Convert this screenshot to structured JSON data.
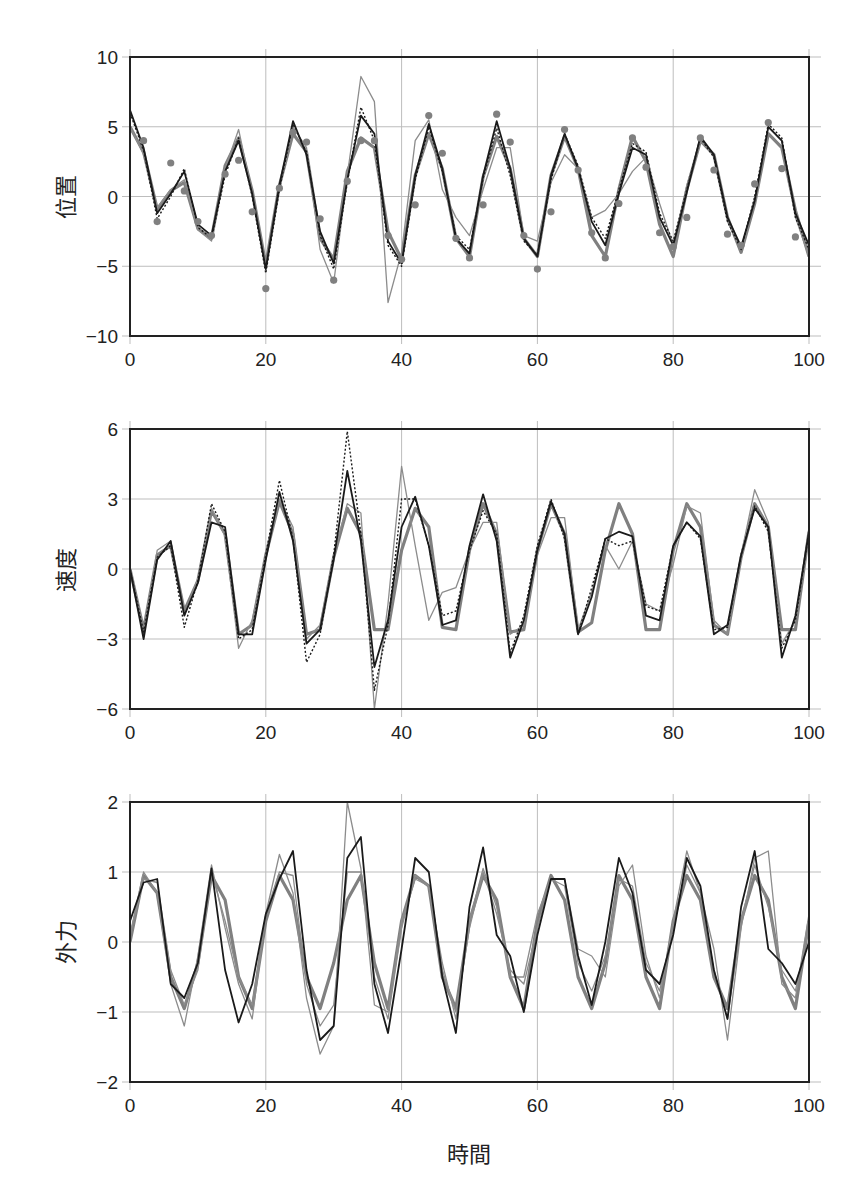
{
  "figure": {
    "xlabel": "時間",
    "x_ticks": [
      "0",
      "20",
      "40",
      "60",
      "80",
      "100"
    ]
  },
  "panels": [
    {
      "ylabel": "位置",
      "y_ticks": [
        "10",
        "5",
        "0",
        "−5",
        "−10"
      ]
    },
    {
      "ylabel": "速度",
      "y_ticks": [
        "6",
        "3",
        "0",
        "−3",
        "−6"
      ]
    },
    {
      "ylabel": "外力",
      "y_ticks": [
        "2",
        "1",
        "0",
        "−1",
        "−2"
      ]
    }
  ],
  "styles": {
    "true": {
      "color": "#808080",
      "width": 3.2,
      "dash": ""
    },
    "thin_gray": {
      "color": "#8c8c8c",
      "width": 1.3,
      "dash": ""
    },
    "black_solid": {
      "color": "#1a1a1a",
      "width": 1.8,
      "dash": ""
    },
    "black_dotted": {
      "color": "#1a1a1a",
      "width": 1.4,
      "dash": "2,2"
    },
    "dots": {
      "color": "#808080",
      "radius": 3.6
    },
    "axis": "#222222",
    "grid": "#bdbdbd"
  },
  "chart_data": [
    {
      "type": "line",
      "title": "",
      "xlabel": "時間",
      "ylabel": "位置",
      "xlim": [
        0,
        100
      ],
      "ylim": [
        -10,
        10
      ],
      "grid": true,
      "x": [
        0,
        2,
        4,
        6,
        8,
        10,
        12,
        14,
        16,
        18,
        20,
        22,
        24,
        26,
        28,
        30,
        32,
        34,
        36,
        38,
        40,
        42,
        44,
        46,
        48,
        50,
        52,
        54,
        56,
        58,
        60,
        62,
        64,
        66,
        68,
        70,
        72,
        74,
        76,
        78,
        80,
        82,
        84,
        86,
        88,
        90,
        92,
        94,
        96,
        98,
        100
      ],
      "series": [
        {
          "name": "true",
          "style": "true",
          "values": [
            5.0,
            3.2,
            -0.9,
            0.4,
            1.0,
            -2.3,
            -3.0,
            2.2,
            4.2,
            0.4,
            -4.9,
            0.8,
            4.5,
            3.2,
            -3.0,
            -4.5,
            1.8,
            4.2,
            3.5,
            -2.5,
            -4.5,
            1.5,
            4.5,
            2.0,
            -3.0,
            -4.3,
            1.4,
            4.3,
            2.0,
            -3.0,
            -4.3,
            1.5,
            4.3,
            2.0,
            -2.8,
            -4.3,
            0.5,
            4.3,
            2.5,
            -2.0,
            -4.3,
            0.5,
            4.0,
            3.0,
            -1.5,
            -4.0,
            -0.5,
            4.5,
            3.5,
            -1.0,
            -4.3
          ]
        },
        {
          "name": "thin_gray",
          "style": "thin_gray",
          "values": [
            5.0,
            3.0,
            -0.8,
            0.5,
            1.2,
            -2.4,
            -3.2,
            2.0,
            4.8,
            0.2,
            -5.2,
            0.5,
            5.0,
            3.5,
            -3.8,
            -6.2,
            1.5,
            8.6,
            6.8,
            -7.6,
            -4.0,
            4.0,
            5.5,
            0.5,
            -1.5,
            -2.8,
            0.5,
            3.5,
            3.5,
            -2.8,
            -3.2,
            1.0,
            3.0,
            2.0,
            -1.5,
            -1.0,
            0.2,
            1.8,
            2.8,
            -0.5,
            -3.5,
            0.8,
            4.0,
            3.0,
            -1.8,
            -3.8,
            -0.2,
            5.0,
            4.0,
            -1.5,
            -4.3
          ]
        },
        {
          "name": "black_solid",
          "style": "black_solid",
          "values": [
            6.2,
            3.5,
            -1.2,
            0.2,
            1.8,
            -2.0,
            -2.8,
            1.8,
            4.0,
            0.2,
            -5.2,
            0.8,
            5.4,
            3.0,
            -2.5,
            -4.8,
            1.2,
            5.8,
            4.5,
            -3.2,
            -4.8,
            1.5,
            5.2,
            2.0,
            -3.0,
            -4.1,
            1.5,
            5.4,
            2.0,
            -3.0,
            -4.3,
            1.5,
            4.5,
            2.0,
            -1.8,
            -3.5,
            0.2,
            3.5,
            3.0,
            -1.5,
            -3.5,
            0.3,
            4.3,
            3.0,
            -1.5,
            -3.6,
            -0.3,
            5.0,
            4.0,
            -1.2,
            -3.5
          ]
        },
        {
          "name": "black_dotted",
          "style": "black_dotted",
          "values": [
            6.0,
            3.3,
            -1.6,
            0.0,
            2.0,
            -2.2,
            -3.0,
            1.5,
            4.2,
            0.0,
            -5.5,
            0.5,
            5.2,
            3.2,
            -2.8,
            -5.2,
            1.0,
            6.4,
            4.0,
            -3.5,
            -5.0,
            1.2,
            5.0,
            1.8,
            -2.8,
            -3.8,
            1.3,
            4.9,
            1.5,
            -3.2,
            -4.2,
            1.2,
            4.5,
            2.2,
            -1.5,
            -3.0,
            0.5,
            3.8,
            3.2,
            -1.2,
            -3.2,
            0.5,
            4.2,
            2.8,
            -1.8,
            -3.8,
            0.0,
            5.2,
            4.2,
            -1.5,
            -3.8
          ]
        }
      ],
      "observations": {
        "name": "observations",
        "style": "dots",
        "x": [
          2,
          4,
          6,
          8,
          10,
          12,
          14,
          16,
          18,
          20,
          22,
          24,
          26,
          28,
          30,
          32,
          34,
          36,
          38,
          40,
          42,
          44,
          46,
          48,
          50,
          52,
          54,
          56,
          58,
          60,
          62,
          64,
          66,
          68,
          70,
          72,
          74,
          76,
          78,
          80,
          82,
          84,
          86,
          88,
          90,
          92,
          94,
          96,
          98
        ],
        "y": [
          4.0,
          -1.8,
          2.4,
          0.4,
          -1.8,
          -2.8,
          1.6,
          2.6,
          -1.1,
          -6.6,
          0.6,
          4.6,
          3.9,
          -1.6,
          -6.0,
          1.1,
          4.0,
          4.0,
          -2.8,
          -4.5,
          -0.6,
          5.8,
          3.1,
          -3.0,
          -4.4,
          -0.6,
          5.9,
          3.9,
          -2.8,
          -5.2,
          -1.1,
          4.8,
          1.9,
          -2.6,
          -4.4,
          -0.5,
          4.2,
          2.1,
          -2.6,
          -3.6,
          -1.5,
          4.2,
          1.9,
          -2.7,
          -3.5,
          0.9,
          5.3,
          2.0,
          -2.9
        ]
      }
    },
    {
      "type": "line",
      "title": "",
      "xlabel": "時間",
      "ylabel": "速度",
      "xlim": [
        0,
        100
      ],
      "ylim": [
        -6,
        6
      ],
      "grid": true,
      "x": [
        0,
        2,
        4,
        6,
        8,
        10,
        12,
        14,
        16,
        18,
        20,
        22,
        24,
        26,
        28,
        30,
        32,
        34,
        36,
        38,
        40,
        42,
        44,
        46,
        48,
        50,
        52,
        54,
        56,
        58,
        60,
        62,
        64,
        66,
        68,
        70,
        72,
        74,
        76,
        78,
        80,
        82,
        84,
        86,
        88,
        90,
        92,
        94,
        96,
        98,
        100
      ],
      "series": [
        {
          "name": "true",
          "style": "true",
          "values": [
            0.0,
            -2.6,
            0.6,
            1.0,
            -1.8,
            -0.5,
            2.5,
            1.5,
            -2.8,
            -2.4,
            0.6,
            2.9,
            1.5,
            -2.8,
            -2.6,
            0.5,
            2.6,
            1.5,
            -2.6,
            -2.6,
            0.8,
            2.6,
            1.8,
            -2.5,
            -2.6,
            0.8,
            2.8,
            1.5,
            -2.7,
            -2.6,
            0.8,
            2.8,
            1.5,
            -2.7,
            -2.3,
            0.8,
            2.8,
            1.5,
            -2.6,
            -2.6,
            0.8,
            2.8,
            1.8,
            -2.4,
            -2.8,
            0.5,
            2.8,
            1.8,
            -2.6,
            -2.6,
            1.6
          ]
        },
        {
          "name": "thin_gray",
          "style": "thin_gray",
          "values": [
            0.0,
            -2.8,
            0.8,
            1.2,
            -2.0,
            -0.4,
            2.6,
            1.4,
            -3.4,
            -2.2,
            0.5,
            3.0,
            1.8,
            -3.0,
            -2.4,
            0.6,
            2.8,
            2.4,
            -6.0,
            -1.5,
            4.4,
            1.0,
            -2.2,
            -1.0,
            -0.8,
            0.8,
            2.0,
            2.0,
            -2.8,
            -2.4,
            0.6,
            2.2,
            2.2,
            -2.6,
            -1.0,
            1.0,
            0.0,
            1.2,
            -1.5,
            -1.8,
            0.2,
            2.7,
            2.4,
            -2.2,
            -2.8,
            0.6,
            3.4,
            2.0,
            -3.2,
            -2.2,
            1.8
          ]
        },
        {
          "name": "black_solid",
          "style": "black_solid",
          "values": [
            0.0,
            -3.0,
            0.4,
            1.2,
            -2.0,
            -0.6,
            2.0,
            1.8,
            -2.8,
            -2.8,
            0.4,
            3.3,
            1.2,
            -3.2,
            -2.6,
            0.4,
            4.2,
            1.2,
            -4.2,
            -2.2,
            1.8,
            3.1,
            1.0,
            -2.4,
            -2.2,
            1.0,
            3.2,
            1.2,
            -3.8,
            -2.2,
            0.8,
            2.9,
            1.5,
            -2.8,
            -1.2,
            1.3,
            1.6,
            1.4,
            -2.0,
            -2.2,
            1.0,
            2.0,
            1.4,
            -2.8,
            -2.4,
            0.6,
            2.6,
            1.8,
            -3.8,
            -2.0,
            1.6
          ]
        },
        {
          "name": "black_dotted",
          "style": "black_dotted",
          "values": [
            0.0,
            -2.7,
            0.5,
            1.0,
            -2.5,
            -0.5,
            2.8,
            1.6,
            -3.0,
            -2.6,
            0.6,
            3.8,
            1.3,
            -4.0,
            -2.8,
            0.6,
            5.9,
            1.5,
            -5.2,
            -2.4,
            3.0,
            3.0,
            1.0,
            -2.0,
            -1.8,
            0.8,
            2.5,
            1.5,
            -3.6,
            -2.0,
            1.0,
            3.0,
            1.3,
            -2.8,
            -0.8,
            1.3,
            1.0,
            1.2,
            -1.6,
            -1.8,
            1.0,
            2.0,
            1.3,
            -2.6,
            -2.5,
            0.6,
            2.7,
            1.6,
            -3.4,
            -2.2,
            1.6
          ]
        }
      ]
    },
    {
      "type": "line",
      "title": "",
      "xlabel": "時間",
      "ylabel": "外力",
      "xlim": [
        0,
        100
      ],
      "ylim": [
        -2,
        2
      ],
      "grid": true,
      "x": [
        0,
        2,
        4,
        6,
        8,
        10,
        12,
        14,
        16,
        18,
        20,
        22,
        24,
        26,
        28,
        30,
        32,
        34,
        36,
        38,
        40,
        42,
        44,
        46,
        48,
        50,
        52,
        54,
        56,
        58,
        60,
        62,
        64,
        66,
        68,
        70,
        72,
        74,
        76,
        78,
        80,
        82,
        84,
        86,
        88,
        90,
        92,
        94,
        96,
        98,
        100
      ],
      "series": [
        {
          "name": "true",
          "style": "true",
          "values": [
            0.0,
            0.95,
            0.7,
            -0.5,
            -0.95,
            -0.3,
            0.95,
            0.6,
            -0.5,
            -0.95,
            0.3,
            0.95,
            0.6,
            -0.5,
            -0.95,
            -0.3,
            0.6,
            0.95,
            -0.3,
            -0.95,
            0.3,
            0.95,
            0.8,
            -0.5,
            -0.95,
            0.3,
            0.95,
            0.6,
            -0.5,
            -0.95,
            0.3,
            0.95,
            0.6,
            -0.5,
            -0.95,
            -0.3,
            0.95,
            0.6,
            -0.5,
            -0.95,
            0.3,
            0.95,
            0.6,
            -0.5,
            -0.95,
            0.3,
            0.95,
            0.6,
            -0.5,
            -0.95,
            0.3
          ]
        },
        {
          "name": "thin_gray",
          "style": "thin_gray",
          "values": [
            0.1,
            1.0,
            0.7,
            -0.6,
            -1.2,
            -0.2,
            1.1,
            0.2,
            -0.6,
            -1.1,
            0.4,
            1.25,
            0.7,
            -0.8,
            -1.6,
            -1.2,
            2.0,
            1.05,
            -0.9,
            -1.0,
            0.3,
            0.9,
            0.8,
            -0.3,
            -1.1,
            0.3,
            1.05,
            0.5,
            -0.5,
            -0.5,
            0.4,
            0.9,
            0.9,
            -0.1,
            -0.2,
            -0.5,
            0.8,
            1.1,
            -0.2,
            -0.8,
            0.3,
            1.3,
            0.7,
            -0.1,
            -1.4,
            0.2,
            1.2,
            1.3,
            -0.6,
            -0.8,
            0.4
          ]
        },
        {
          "name": "black_solid",
          "style": "black_solid",
          "values": [
            0.3,
            0.85,
            0.9,
            -0.6,
            -0.8,
            -0.3,
            1.05,
            -0.4,
            -1.15,
            -0.6,
            0.4,
            0.9,
            1.3,
            -0.4,
            -1.4,
            -1.2,
            1.2,
            1.5,
            -0.6,
            -1.3,
            -0.1,
            1.2,
            1.0,
            -0.5,
            -1.3,
            0.5,
            1.35,
            0.1,
            -0.2,
            -1.0,
            0.1,
            0.9,
            0.9,
            -0.2,
            -0.9,
            0.0,
            1.2,
            0.7,
            -0.4,
            -0.6,
            0.1,
            1.2,
            0.8,
            -0.4,
            -1.1,
            0.5,
            1.3,
            -0.1,
            -0.3,
            -0.6,
            0.0
          ]
        },
        {
          "name": "gray_mid",
          "style": "thin_gray",
          "values": [
            0.1,
            0.9,
            0.85,
            -0.4,
            -0.9,
            -0.4,
            1.0,
            0.3,
            -0.5,
            -0.9,
            0.4,
            1.0,
            0.95,
            -0.6,
            -1.2,
            -0.9,
            1.0,
            1.0,
            -0.5,
            -1.1,
            0.2,
            0.95,
            0.8,
            -0.4,
            -1.0,
            0.2,
            1.0,
            0.4,
            -0.4,
            -0.6,
            0.2,
            0.9,
            0.8,
            -0.3,
            -0.7,
            -0.2,
            0.9,
            0.8,
            -0.3,
            -0.7,
            0.2,
            1.1,
            0.7,
            -0.4,
            -1.1,
            0.3,
            1.1,
            0.5,
            -0.4,
            -0.7,
            0.2
          ]
        }
      ]
    }
  ]
}
